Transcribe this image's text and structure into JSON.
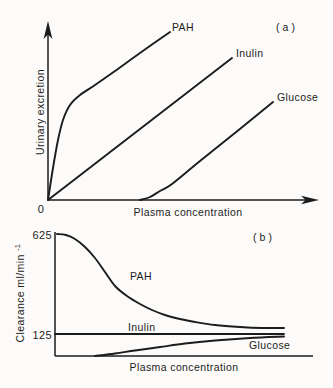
{
  "figure": {
    "background_color": "#fcfbf9",
    "ink_color": "#1c1c1c"
  },
  "chart_data": [
    {
      "type": "line",
      "panel": "a",
      "panel_tag": "(a)",
      "xlabel": "Plasma concentration",
      "ylabel": "Urinary excretion",
      "origin_label": "0",
      "axes_note": "both axes unlabeled magnitudes; y-axis arrow up, x-axis arrow right",
      "series": [
        {
          "name": "PAH",
          "shape": "rises very steeply from the origin, bends at a knee, then increases linearly; highest excretion curve",
          "smooth": true,
          "points_px": [
            [
              48,
              200
            ],
            [
              53,
              168
            ],
            [
              58,
              140
            ],
            [
              63,
              120
            ],
            [
              70,
              105
            ],
            [
              80,
              95
            ],
            [
              95,
              85
            ],
            [
              115,
              71
            ],
            [
              140,
              53
            ],
            [
              170,
              32
            ]
          ]
        },
        {
          "name": "Inulin",
          "shape": "straight line of constant slope through the origin",
          "smooth": false,
          "points_px": [
            [
              48,
              200
            ],
            [
              232,
              58
            ]
          ]
        },
        {
          "name": "Glucose",
          "shape": "zero excretion until a threshold plasma concentration, then rises linearly parallel to inulin",
          "smooth": true,
          "points_px": [
            [
              140,
              200
            ],
            [
              150,
              197
            ],
            [
              160,
              191
            ],
            [
              172,
              184
            ],
            [
              200,
              161
            ],
            [
              235,
              133
            ],
            [
              273,
              102
            ]
          ]
        }
      ]
    },
    {
      "type": "line",
      "panel": "b",
      "panel_tag": "(b)",
      "xlabel": "Plasma concentration",
      "ylabel": "Clearance ml/min",
      "ylabel_superscript": "-1",
      "yticks": [
        {
          "label": "625",
          "value": 625
        },
        {
          "label": "125",
          "value": 125
        }
      ],
      "series": [
        {
          "name": "PAH",
          "shape": "starts at clearance 625, declines sigmoidally with rising plasma concentration toward the inulin level",
          "smooth": true,
          "points_px": [
            [
              57,
              234
            ],
            [
              66,
              235
            ],
            [
              75,
              239
            ],
            [
              85,
              247
            ],
            [
              95,
              258
            ],
            [
              105,
              272
            ],
            [
              115,
              286
            ],
            [
              127,
              296
            ],
            [
              140,
              304
            ],
            [
              152,
              310
            ],
            [
              165,
              315
            ],
            [
              180,
              319
            ],
            [
              195,
              322
            ],
            [
              215,
              325
            ],
            [
              240,
              327
            ],
            [
              262,
              328
            ],
            [
              284,
              328
            ]
          ]
        },
        {
          "name": "Inulin",
          "shape": "constant clearance of 125 independent of plasma concentration",
          "smooth": false,
          "stroke_width": 2.4,
          "points_px": [
            [
              55,
              334
            ],
            [
              284,
              334
            ]
          ]
        },
        {
          "name": "Glucose",
          "shape": "zero clearance until a threshold, then rises and approaches the inulin level from below",
          "smooth": true,
          "points_px": [
            [
              95,
              356
            ],
            [
              115,
              353.5
            ],
            [
              135,
              350.5
            ],
            [
              160,
              347
            ],
            [
              185,
              343.5
            ],
            [
              215,
              340.5
            ],
            [
              250,
              338
            ],
            [
              284,
              336.5
            ]
          ]
        }
      ]
    }
  ]
}
